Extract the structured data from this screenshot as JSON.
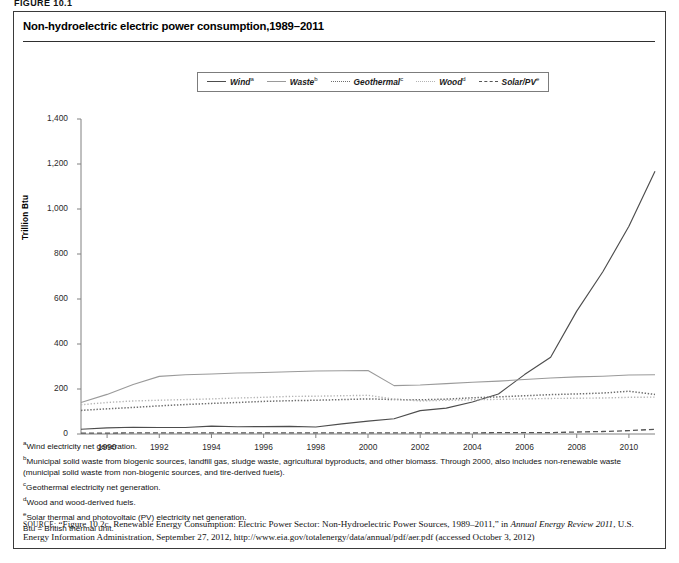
{
  "figure_label": "FIGURE 10.1",
  "title": "Non-hydroelectric electric power consumption,1989–2011",
  "legend": {
    "items": [
      {
        "label": "Wind",
        "note": "a",
        "style": "solid"
      },
      {
        "label": "Waste",
        "note": "b",
        "style": "solid-light"
      },
      {
        "label": "Geothermal",
        "note": "c",
        "style": "dot"
      },
      {
        "label": "Wood",
        "note": "d",
        "style": "dot-light"
      },
      {
        "label": "Solar/PV",
        "note": "e",
        "style": "dash"
      }
    ]
  },
  "chart_data": {
    "type": "line",
    "title": "Non-hydroelectric electric power consumption,1989–2011",
    "xlabel": "",
    "ylabel": "Trillion Btu",
    "xlim": [
      1989,
      2011
    ],
    "ylim": [
      0,
      1400
    ],
    "yticks": [
      "0",
      "200",
      "400",
      "600",
      "800",
      "1,000",
      "1,200",
      "1,400"
    ],
    "ytick_values": [
      0,
      200,
      400,
      600,
      800,
      1000,
      1200,
      1400
    ],
    "xticks": [
      "1990",
      "1992",
      "1994",
      "1996",
      "1998",
      "2000",
      "2002",
      "2004",
      "2006",
      "2008",
      "2010"
    ],
    "xtick_values": [
      1990,
      1992,
      1994,
      1996,
      1998,
      2000,
      2002,
      2004,
      2006,
      2008,
      2010
    ],
    "grid": false,
    "legend_position": "top-center",
    "x": [
      1989,
      1990,
      1991,
      1992,
      1993,
      1994,
      1995,
      1996,
      1997,
      1998,
      1999,
      2000,
      2001,
      2002,
      2003,
      2004,
      2005,
      2006,
      2007,
      2008,
      2009,
      2010,
      2011
    ],
    "series": [
      {
        "name": "Wind",
        "note": "a",
        "color": "#4d4d4d",
        "style": "solid",
        "values": [
          21,
          27,
          30,
          29,
          29,
          35,
          32,
          33,
          34,
          31,
          45,
          57,
          68,
          104,
          115,
          142,
          178,
          264,
          341,
          546,
          721,
          923,
          1168
        ]
      },
      {
        "name": "Waste",
        "note": "b",
        "color": "#9a9a9a",
        "style": "solid-light",
        "values": [
          140,
          176,
          220,
          256,
          263,
          267,
          271,
          273,
          277,
          280,
          281,
          282,
          215,
          218,
          224,
          230,
          235,
          242,
          249,
          254,
          257,
          262,
          263
        ]
      },
      {
        "name": "Geothermal",
        "note": "c",
        "color": "#6e6e6e",
        "style": "dot",
        "values": [
          105,
          112,
          118,
          125,
          131,
          136,
          140,
          145,
          148,
          150,
          153,
          156,
          153,
          152,
          155,
          161,
          165,
          170,
          175,
          178,
          182,
          190,
          176
        ]
      },
      {
        "name": "Wood",
        "note": "d",
        "color": "#b3b3b3",
        "style": "dot-light",
        "values": [
          130,
          140,
          147,
          150,
          153,
          156,
          160,
          163,
          167,
          168,
          170,
          172,
          155,
          147,
          150,
          152,
          154,
          156,
          158,
          159,
          160,
          163,
          164
        ]
      },
      {
        "name": "Solar/PV",
        "note": "e",
        "color": "#555555",
        "style": "dash",
        "values": [
          4,
          4,
          5,
          5,
          5,
          5,
          5,
          5,
          5,
          5,
          5,
          5,
          5,
          5,
          5,
          5,
          6,
          6,
          6,
          9,
          11,
          15,
          21
        ]
      }
    ]
  },
  "footnotes": [
    {
      "marker": "a",
      "text": "Wind electricity net generation."
    },
    {
      "marker": "b",
      "text": "Municipal solid waste from biogenic sources, landfill gas, sludge waste, agricultural byproducts, and other biomass. Through 2000, also includes non-renewable waste (municipal solid waste from non-biogenic sources, and tire-derived fuels)."
    },
    {
      "marker": "c",
      "text": "Geothermal electricity net generation."
    },
    {
      "marker": "d",
      "text": "Wood and wood-derived fuels."
    },
    {
      "marker": "e",
      "text": "Solar thermal and photovoltaic (PV) electricity net generation."
    }
  ],
  "abbreviation": "Btu = British thermal unit.",
  "source": {
    "prefix": "SOURCE:",
    "part1": " “Figure 10.2c. Renewable Energy Consumption: Electric Power Sector: Non-Hydroelectric Power Sources, 1989–2011,” in ",
    "italic1": "Annual Energy Review 2011",
    "part2": ", U.S. Energy Information Administration, September 27, 2012, http://www.eia.gov/totalenergy/data/annual/pdf/aer.pdf (accessed October 3, 2012)"
  }
}
